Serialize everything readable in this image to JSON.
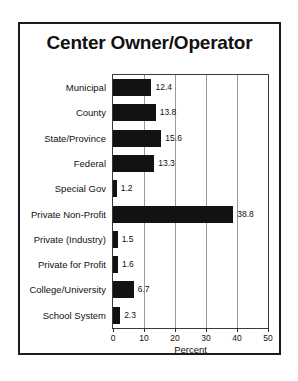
{
  "figure": {
    "title": "Center Owner/Operator",
    "border_color": "#1c1c1c",
    "background": "#ffffff"
  },
  "chart_data": {
    "type": "bar",
    "orientation": "horizontal",
    "title": "Center Owner/Operator",
    "xlabel": "Percent",
    "ylabel": "",
    "xlim": [
      0,
      50
    ],
    "xticks": [
      0,
      10,
      20,
      30,
      40,
      50
    ],
    "xtick_labels": [
      "0",
      "10",
      "20",
      "30",
      "40",
      "50"
    ],
    "grid": "vertical",
    "legend": "none",
    "bar_color": "#121212",
    "categories": [
      "Municipal",
      "County",
      "State/Province",
      "Federal",
      "Special Gov",
      "Private Non-Profit",
      "Private (Industry)",
      "Private for Profit",
      "College/University",
      "School System"
    ],
    "values": [
      12.4,
      13.8,
      15.6,
      13.3,
      1.2,
      38.8,
      1.5,
      1.6,
      6.7,
      2.3
    ],
    "value_labels": [
      "12.4",
      "13.8",
      "15.6",
      "13.3",
      "1.2",
      "38.8",
      "1.5",
      "1.6",
      "6.7",
      "2.3"
    ]
  }
}
